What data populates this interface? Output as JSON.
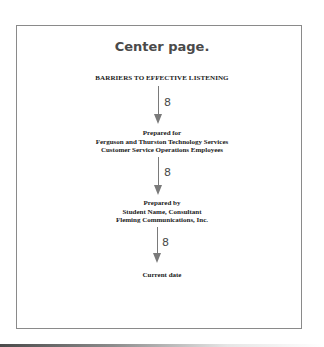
{
  "instruction": {
    "label": "Center page."
  },
  "document": {
    "title": "BARRIERS TO EFFECTIVE LISTENING",
    "prepared_for": {
      "label": "Prepared for",
      "line1": "Ferguson and Thurston Technology Services",
      "line2": "Customer Service Operations Employees"
    },
    "prepared_by": {
      "label": "Prepared by",
      "line1": "Student Name, Consultant",
      "line2": "Fleming Communications, Inc."
    },
    "date": "Current date"
  },
  "spacing_annotations": [
    {
      "label": "8",
      "icon": "down-arrow-icon"
    },
    {
      "label": "8",
      "icon": "down-arrow-icon"
    },
    {
      "label": "8",
      "icon": "down-arrow-icon"
    }
  ],
  "colors": {
    "frame": "#8a8a8a",
    "annotation": "#7a7a7a",
    "heading": "#4a4a4a",
    "body_text": "#1a1a1a"
  }
}
